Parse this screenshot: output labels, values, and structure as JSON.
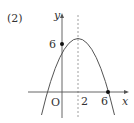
{
  "problem_label": "(2)",
  "axes": {
    "x_label": "x",
    "y_label": "y",
    "origin_label": "O"
  },
  "ticks": {
    "x_tick_2": "2",
    "x_tick_6": "6",
    "y_tick_6": "6"
  },
  "curve": {
    "type": "parabola",
    "equation": "y = -1/2 (x + 2)(x - 6)",
    "vertex": [
      2,
      8
    ],
    "roots": [
      -2,
      6
    ],
    "y_intercept": 6,
    "axis_of_symmetry": "x = 2"
  },
  "marked_points": [
    {
      "label": "6",
      "coords": [
        0,
        6
      ]
    },
    {
      "label": "6",
      "coords": [
        6,
        0
      ]
    }
  ],
  "colors": {
    "line": "#555555",
    "dashed": "#888888",
    "point": "#111111"
  }
}
